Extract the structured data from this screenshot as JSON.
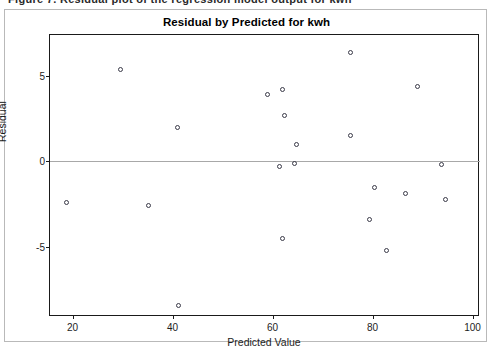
{
  "top_strip": {
    "ghost_text": "Figure 7. Residual plot of the regression model output for kwh"
  },
  "chart_data": {
    "type": "scatter",
    "title": "Residual by Predicted for kwh",
    "xlabel": "Predicted Value",
    "ylabel": "Residual",
    "xlim": [
      15.5,
      101.5
    ],
    "ylim": [
      -9.1,
      7.4
    ],
    "xticks": [
      20,
      40,
      60,
      80,
      100
    ],
    "yticks": [
      5,
      0,
      -5
    ],
    "grid": false,
    "legend": null,
    "reference_line": {
      "axis": "y",
      "value": 0,
      "color": "#a8a8a8"
    },
    "marker": {
      "shape": "circle",
      "filled": false,
      "edge_color": "#3a3a48",
      "size": 5
    },
    "points": [
      {
        "x": 18.7,
        "y": -2.4
      },
      {
        "x": 29.6,
        "y": 5.4
      },
      {
        "x": 35.2,
        "y": -2.6
      },
      {
        "x": 41.0,
        "y": 2.0
      },
      {
        "x": 41.2,
        "y": -8.4
      },
      {
        "x": 59.0,
        "y": 3.9
      },
      {
        "x": 61.9,
        "y": 4.2
      },
      {
        "x": 62.4,
        "y": 2.7
      },
      {
        "x": 61.4,
        "y": -0.3
      },
      {
        "x": 64.4,
        "y": -0.1
      },
      {
        "x": 62.0,
        "y": -4.5
      },
      {
        "x": 64.7,
        "y": 1.0
      },
      {
        "x": 75.6,
        "y": 6.4
      },
      {
        "x": 75.6,
        "y": 1.5
      },
      {
        "x": 79.3,
        "y": -3.4
      },
      {
        "x": 80.3,
        "y": -1.5
      },
      {
        "x": 82.7,
        "y": -5.2
      },
      {
        "x": 86.5,
        "y": -1.9
      },
      {
        "x": 88.9,
        "y": 4.4
      },
      {
        "x": 93.8,
        "y": -0.2
      },
      {
        "x": 94.6,
        "y": -2.2
      }
    ]
  }
}
